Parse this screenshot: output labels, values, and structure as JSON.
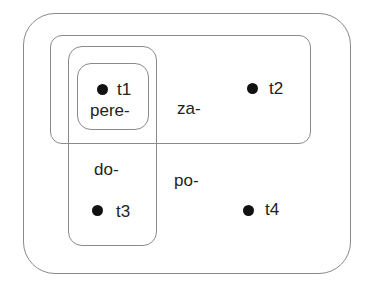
{
  "diagram": {
    "regions": [
      {
        "id": "outer",
        "label": "po-"
      },
      {
        "id": "za",
        "label": "za-"
      },
      {
        "id": "do",
        "label": "do-"
      },
      {
        "id": "pere",
        "label": "pere-"
      }
    ],
    "points": [
      {
        "id": "t1",
        "label": "t1"
      },
      {
        "id": "t2",
        "label": "t2"
      },
      {
        "id": "t3",
        "label": "t3"
      },
      {
        "id": "t4",
        "label": "t4"
      }
    ]
  }
}
